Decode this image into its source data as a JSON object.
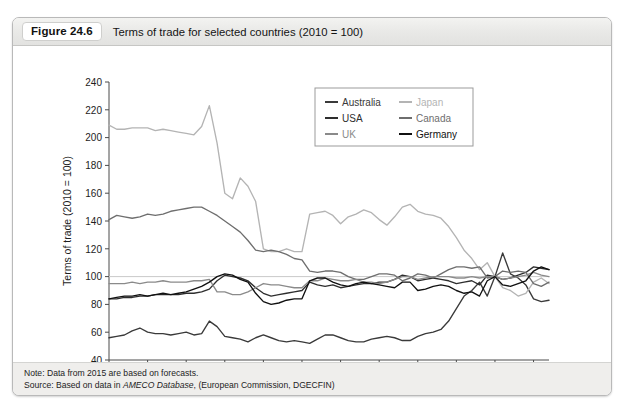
{
  "figure": {
    "number": "Figure 24.6",
    "title": "Terms of trade for selected countries (2010 = 100)"
  },
  "notes": {
    "note_prefix": "Note: Data from 2015 are based on forecasts.",
    "source_prefix": "Source: Based on data in ",
    "source_italic": "AMECO Database",
    "source_suffix": ", (European Commission, DGECFIN)"
  },
  "chart_data": {
    "type": "line",
    "title": "Terms of trade for selected countries (2010 = 100)",
    "xlabel": "",
    "ylabel": "Terms of trade (2010 = 100)",
    "xlim": [
      1960,
      2017
    ],
    "ylim": [
      40,
      240
    ],
    "ytick_step": 20,
    "yticks": [
      40,
      60,
      80,
      100,
      120,
      140,
      160,
      180,
      200,
      220,
      240
    ],
    "xticks": [
      1960,
      1965,
      1970,
      1975,
      1980,
      1985,
      1990,
      1995,
      2000,
      2005,
      2010,
      2015
    ],
    "grid": false,
    "reference_line": 100,
    "legend_position": "upper-right",
    "x": [
      1960,
      1961,
      1962,
      1963,
      1964,
      1965,
      1966,
      1967,
      1968,
      1969,
      1970,
      1971,
      1972,
      1973,
      1974,
      1975,
      1976,
      1977,
      1978,
      1979,
      1980,
      1981,
      1982,
      1983,
      1984,
      1985,
      1986,
      1987,
      1988,
      1989,
      1990,
      1991,
      1992,
      1993,
      1994,
      1995,
      1996,
      1997,
      1998,
      1999,
      2000,
      2001,
      2002,
      2003,
      2004,
      2005,
      2006,
      2007,
      2008,
      2009,
      2010,
      2011,
      2012,
      2013,
      2014,
      2015,
      2016,
      2017
    ],
    "series": [
      {
        "name": "Australia",
        "color": "#3a3a3a",
        "values": [
          56,
          57,
          58,
          61,
          63,
          60,
          59,
          59,
          58,
          59,
          60,
          58,
          59,
          68,
          64,
          57,
          56,
          55,
          53,
          56,
          58,
          56,
          54,
          53,
          54,
          53,
          52,
          55,
          58,
          58,
          56,
          54,
          53,
          53,
          55,
          56,
          57,
          56,
          54,
          54,
          57,
          59,
          60,
          62,
          68,
          77,
          86,
          90,
          96,
          86,
          100,
          117,
          102,
          99,
          94,
          84,
          82,
          83
        ]
      },
      {
        "name": "Japan",
        "color": "#b4b4b4",
        "values": [
          209,
          206,
          206,
          207,
          207,
          207,
          205,
          206,
          205,
          204,
          203,
          202,
          208,
          223,
          196,
          160,
          156,
          171,
          165,
          154,
          120,
          118,
          118,
          120,
          118,
          118,
          145,
          146,
          147,
          144,
          138,
          143,
          145,
          148,
          146,
          141,
          137,
          143,
          150,
          152,
          147,
          145,
          144,
          142,
          136,
          128,
          119,
          113,
          105,
          110,
          100,
          92,
          90,
          86,
          88,
          96,
          99,
          95
        ]
      },
      {
        "name": "USA",
        "color": "#2e2e2e",
        "values": [
          84,
          84,
          85,
          85,
          86,
          86,
          87,
          87,
          87,
          87,
          88,
          88,
          89,
          91,
          97,
          101,
          100,
          99,
          97,
          92,
          88,
          86,
          87,
          88,
          89,
          90,
          96,
          94,
          93,
          94,
          92,
          93,
          94,
          95,
          95,
          96,
          96,
          98,
          101,
          100,
          97,
          98,
          99,
          98,
          97,
          95,
          96,
          97,
          94,
          101,
          100,
          98,
          99,
          101,
          103,
          107,
          106,
          105
        ]
      },
      {
        "name": "Canada",
        "color": "#6e6e6e",
        "values": [
          141,
          144,
          143,
          142,
          143,
          145,
          144,
          145,
          147,
          148,
          149,
          150,
          150,
          147,
          144,
          140,
          136,
          132,
          126,
          119,
          118,
          119,
          118,
          116,
          113,
          112,
          104,
          103,
          104,
          104,
          103,
          100,
          98,
          98,
          100,
          102,
          102,
          101,
          97,
          99,
          102,
          101,
          99,
          102,
          105,
          107,
          107,
          106,
          107,
          99,
          100,
          104,
          103,
          104,
          103,
          95,
          93,
          96
        ]
      },
      {
        "name": "UK",
        "color": "#8a8a8a",
        "values": [
          95,
          95,
          95,
          96,
          95,
          96,
          96,
          97,
          96,
          96,
          96,
          97,
          97,
          98,
          89,
          89,
          87,
          87,
          89,
          92,
          95,
          94,
          94,
          93,
          92,
          92,
          97,
          97,
          99,
          98,
          97,
          97,
          98,
          96,
          96,
          95,
          96,
          98,
          100,
          100,
          98,
          99,
          100,
          100,
          100,
          99,
          99,
          100,
          99,
          100,
          100,
          98,
          99,
          100,
          101,
          103,
          101,
          100
        ]
      },
      {
        "name": "Germany",
        "color": "#111111",
        "values": [
          84,
          85,
          86,
          86,
          87,
          86,
          87,
          88,
          87,
          88,
          89,
          91,
          93,
          96,
          100,
          102,
          101,
          98,
          96,
          88,
          82,
          80,
          81,
          83,
          84,
          84,
          97,
          99,
          99,
          96,
          94,
          93,
          95,
          96,
          95,
          94,
          93,
          92,
          96,
          96,
          90,
          91,
          93,
          94,
          93,
          90,
          88,
          89,
          86,
          97,
          100,
          94,
          93,
          95,
          97,
          104,
          107,
          105
        ]
      }
    ]
  }
}
